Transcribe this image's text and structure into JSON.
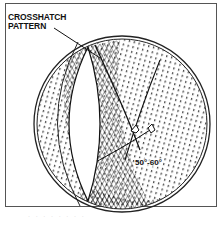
{
  "figure": {
    "callout_line1": "CROSSHATCH",
    "callout_line2": "PATTERN",
    "angle_label": "50°-60°",
    "caption": "· · · · · · · ·"
  },
  "colors": {
    "ink": "#111111",
    "frame": "#555555",
    "background": "#ffffff"
  }
}
